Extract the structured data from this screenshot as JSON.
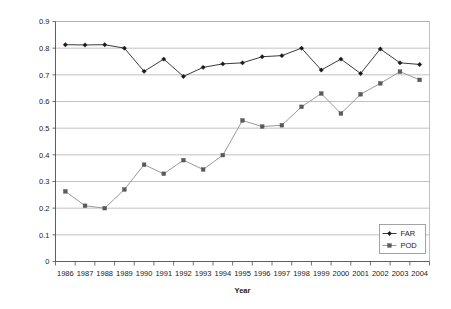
{
  "chart_data": {
    "type": "line",
    "title": "",
    "xlabel": "Year",
    "ylabel": "",
    "categories": [
      "1986",
      "1987",
      "1988",
      "1989",
      "1990",
      "1991",
      "1992",
      "1993",
      "1994",
      "1995",
      "1996",
      "1997",
      "1998",
      "1999",
      "2000",
      "2001",
      "2002",
      "2003",
      "2004"
    ],
    "x": [
      1986,
      1987,
      1988,
      1989,
      1990,
      1991,
      1992,
      1993,
      1994,
      1995,
      1996,
      1997,
      1998,
      1999,
      2000,
      2001,
      2002,
      2003,
      2004
    ],
    "series": [
      {
        "name": "FAR",
        "color": "#3b3b3b",
        "marker": "diamond",
        "values": [
          0.813,
          0.812,
          0.813,
          0.8,
          0.713,
          0.759,
          0.694,
          0.728,
          0.741,
          0.745,
          0.768,
          0.772,
          0.8,
          0.718,
          0.759,
          0.705,
          0.797,
          0.745,
          0.739
        ]
      },
      {
        "name": "POD",
        "color": "#9a9a9a",
        "marker": "square",
        "values": [
          0.263,
          0.209,
          0.2,
          0.27,
          0.363,
          0.329,
          0.38,
          0.345,
          0.399,
          0.529,
          0.506,
          0.511,
          0.58,
          0.63,
          0.555,
          0.627,
          0.668,
          0.712,
          0.681
        ]
      }
    ],
    "ylim": [
      0,
      0.9
    ],
    "yticks": [
      "0",
      "0.1",
      "0.2",
      "0.3",
      "0.4",
      "0.5",
      "0.6",
      "0.7",
      "0.8",
      "0.9"
    ],
    "ytick_values": [
      0,
      0.1,
      0.2,
      0.3,
      0.4,
      0.5,
      0.6,
      0.7,
      0.8,
      0.9
    ],
    "grid": true,
    "grid_axis": "y",
    "legend_position": "inside-bottom-right",
    "legend_entries": [
      "FAR",
      "POD"
    ]
  }
}
